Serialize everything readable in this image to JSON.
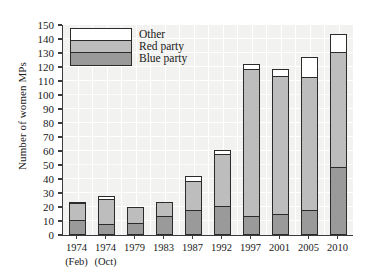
{
  "chart": {
    "type": "bar",
    "ylabel": "Number of women MPs",
    "xlabel": "",
    "title": ""
  },
  "legend": {
    "position": "top-left-inside",
    "items": [
      {
        "label": "Other",
        "color": "#ffffff",
        "key": "other"
      },
      {
        "label": "Red party",
        "color": "#bdbdbd",
        "key": "red"
      },
      {
        "label": "Blue party",
        "color": "#9a9a9a",
        "key": "blue"
      }
    ]
  },
  "yaxis": {
    "min": 0,
    "max": 150,
    "step": 10,
    "ticks": [
      "0",
      "10",
      "20",
      "30",
      "40",
      "50",
      "60",
      "70",
      "80",
      "90",
      "100",
      "110",
      "120",
      "130",
      "140",
      "150"
    ]
  },
  "xaxis": {
    "categories": [
      {
        "year": "1974",
        "sub": "(Feb)"
      },
      {
        "year": "1974",
        "sub": "(Oct)"
      },
      {
        "year": "1979",
        "sub": ""
      },
      {
        "year": "1983",
        "sub": ""
      },
      {
        "year": "1987",
        "sub": ""
      },
      {
        "year": "1992",
        "sub": ""
      },
      {
        "year": "1997",
        "sub": ""
      },
      {
        "year": "2001",
        "sub": ""
      },
      {
        "year": "2005",
        "sub": ""
      },
      {
        "year": "2010",
        "sub": ""
      }
    ]
  },
  "chart_data": {
    "type": "bar",
    "stacked": true,
    "title": "",
    "xlabel": "",
    "ylabel": "Number of women MPs",
    "ylim": [
      0,
      150
    ],
    "ytick_step": 10,
    "grid": true,
    "legend_position": "top-left-inside",
    "categories": [
      "1974 (Feb)",
      "1974 (Oct)",
      "1979",
      "1983",
      "1987",
      "1992",
      "1997",
      "2001",
      "2005",
      "2010"
    ],
    "series": [
      {
        "name": "Blue party",
        "color": "#9a9a9a",
        "values": [
          10,
          7,
          8,
          13,
          17,
          20,
          13,
          14,
          17,
          48
        ]
      },
      {
        "name": "Red party",
        "color": "#bdbdbd",
        "values": [
          12,
          18,
          11,
          10,
          21,
          37,
          105,
          99,
          95,
          82
        ]
      },
      {
        "name": "Other",
        "color": "#ffffff",
        "values": [
          1,
          2,
          0,
          0,
          3,
          3,
          3,
          5,
          14,
          13
        ]
      }
    ],
    "totals": [
      23,
      27,
      19,
      23,
      41,
      60,
      121,
      118,
      126,
      143
    ]
  }
}
